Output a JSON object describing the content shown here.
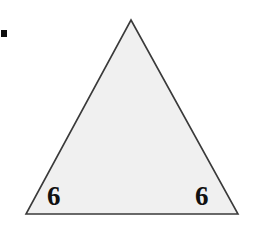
{
  "figure": {
    "canvas": {
      "width": 254,
      "height": 226,
      "background_color": "#ffffff"
    },
    "corner_mark": {
      "name": "black-square-mark",
      "color": "#0d0d0d",
      "x": 1,
      "y": 30,
      "width": 6,
      "height": 7
    },
    "shape": {
      "kind": "triangle",
      "fill_color": "#f0f0f0",
      "stroke_color": "#3a3a3a",
      "stroke_width": 1.6,
      "points": "131,20 238,214 26,214",
      "vertices": [
        {
          "name": "apex",
          "x": 131,
          "y": 20
        },
        {
          "name": "bottom-right",
          "x": 238,
          "y": 214
        },
        {
          "name": "bottom-left",
          "x": 26,
          "y": 214
        }
      ]
    },
    "labels": [
      {
        "id": "left",
        "text": "6",
        "x": 47,
        "y": 183
      },
      {
        "id": "right",
        "text": "6",
        "x": 195,
        "y": 183
      }
    ]
  },
  "chart_data": {
    "type": "diagram",
    "shape": "triangle",
    "labeled_values": [
      6,
      6
    ],
    "label_unit": "",
    "annotations": [
      "6",
      "6"
    ],
    "vertices": [
      [
        131,
        20
      ],
      [
        238,
        214
      ],
      [
        26,
        214
      ]
    ]
  }
}
